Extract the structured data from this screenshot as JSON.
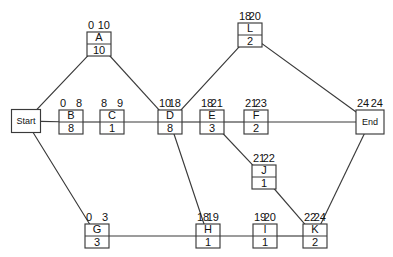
{
  "diagram": {
    "type": "activity-on-node-network",
    "background_color": "#ffffff",
    "line_color": "#3a3a3a",
    "text_color": "#111111"
  },
  "nodes": [
    {
      "id": "start",
      "label": "Start",
      "kind": "terminal",
      "duration": "",
      "early_start": "",
      "early_finish": "",
      "x": 26,
      "y": 121,
      "w": 29,
      "h": 23
    },
    {
      "id": "A",
      "label": "A",
      "kind": "activity",
      "duration": "10",
      "early_start": "0",
      "early_finish": "10",
      "x": 99,
      "y": 44,
      "w": 24,
      "h": 24
    },
    {
      "id": "B",
      "label": "B",
      "kind": "activity",
      "duration": "8",
      "early_start": "0",
      "early_finish": "8",
      "x": 71,
      "y": 122,
      "w": 24,
      "h": 24
    },
    {
      "id": "C",
      "label": "C",
      "kind": "activity",
      "duration": "1",
      "early_start": "8",
      "early_finish": "9",
      "x": 112,
      "y": 122,
      "w": 24,
      "h": 24
    },
    {
      "id": "D",
      "label": "D",
      "kind": "activity",
      "duration": "8",
      "early_start": "10",
      "early_finish": "18",
      "x": 170,
      "y": 122,
      "w": 24,
      "h": 24
    },
    {
      "id": "E",
      "label": "E",
      "kind": "activity",
      "duration": "3",
      "early_start": "18",
      "early_finish": "21",
      "x": 212,
      "y": 122,
      "w": 24,
      "h": 24
    },
    {
      "id": "F",
      "label": "F",
      "kind": "activity",
      "duration": "2",
      "early_start": "21",
      "early_finish": "23",
      "x": 256,
      "y": 122,
      "w": 24,
      "h": 24
    },
    {
      "id": "L",
      "label": "L",
      "kind": "activity",
      "duration": "2",
      "early_start": "18",
      "early_finish": "20",
      "x": 250,
      "y": 35,
      "w": 24,
      "h": 24
    },
    {
      "id": "J",
      "label": "J",
      "kind": "activity",
      "duration": "1",
      "early_start": "21",
      "early_finish": "22",
      "x": 264,
      "y": 177,
      "w": 24,
      "h": 24
    },
    {
      "id": "G",
      "label": "G",
      "kind": "activity",
      "duration": "3",
      "early_start": "0",
      "early_finish": "3",
      "x": 97,
      "y": 236,
      "w": 24,
      "h": 24
    },
    {
      "id": "H",
      "label": "H",
      "kind": "activity",
      "duration": "1",
      "early_start": "18",
      "early_finish": "19",
      "x": 208,
      "y": 236,
      "w": 24,
      "h": 24
    },
    {
      "id": "I",
      "label": "I",
      "kind": "activity",
      "duration": "1",
      "early_start": "19",
      "early_finish": "20",
      "x": 265,
      "y": 236,
      "w": 24,
      "h": 24
    },
    {
      "id": "K",
      "label": "K",
      "kind": "activity",
      "duration": "2",
      "early_start": "22",
      "early_finish": "24",
      "x": 315,
      "y": 236,
      "w": 24,
      "h": 24
    },
    {
      "id": "end",
      "label": "End",
      "kind": "terminal",
      "duration": "",
      "early_start": "24",
      "early_finish": "24",
      "x": 370,
      "y": 122,
      "w": 28,
      "h": 24
    }
  ],
  "edges": [
    {
      "id": "start-A",
      "from": "start",
      "to": "A"
    },
    {
      "id": "start-B",
      "from": "start",
      "to": "B"
    },
    {
      "id": "start-G",
      "from": "start",
      "to": "G"
    },
    {
      "id": "B-C",
      "from": "B",
      "to": "C"
    },
    {
      "id": "C-D",
      "from": "C",
      "to": "D"
    },
    {
      "id": "A-D",
      "from": "A",
      "to": "D"
    },
    {
      "id": "D-E",
      "from": "D",
      "to": "E"
    },
    {
      "id": "D-L",
      "from": "D",
      "to": "L"
    },
    {
      "id": "D-H",
      "from": "D",
      "to": "H"
    },
    {
      "id": "E-F",
      "from": "E",
      "to": "F"
    },
    {
      "id": "E-J",
      "from": "E",
      "to": "J"
    },
    {
      "id": "F-End",
      "from": "F",
      "to": "end"
    },
    {
      "id": "L-End",
      "from": "L",
      "to": "end"
    },
    {
      "id": "J-K",
      "from": "J",
      "to": "K"
    },
    {
      "id": "G-H",
      "from": "G",
      "to": "H"
    },
    {
      "id": "H-I",
      "from": "H",
      "to": "I"
    },
    {
      "id": "I-K",
      "from": "I",
      "to": "K"
    },
    {
      "id": "K-End",
      "from": "K",
      "to": "end"
    }
  ]
}
